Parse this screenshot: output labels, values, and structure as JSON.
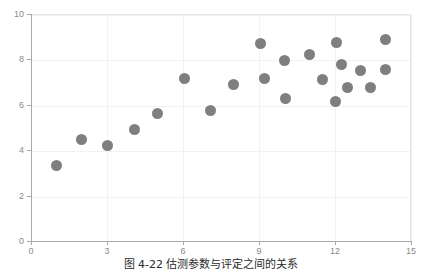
{
  "caption": "图 4-22  估测参数与评定之间的关系",
  "colors": {
    "marker": "#7f7f7f",
    "axis": "#a9a9a9",
    "grid": "#f2f2f2",
    "tick_label": "#8a8a8a",
    "background": "#ffffff",
    "frame": "#e3e3e3"
  },
  "chart_data": {
    "type": "scatter",
    "title": "",
    "xlabel": "",
    "ylabel": "",
    "xlim": [
      0,
      15
    ],
    "ylim": [
      0,
      10
    ],
    "xticks": [
      0,
      3,
      6,
      9,
      12,
      15
    ],
    "yticks": [
      0,
      2,
      4,
      6,
      8,
      10
    ],
    "grid": true,
    "legend": "none",
    "series": [
      {
        "name": "观测值",
        "marker": "circle",
        "color": "#7f7f7f",
        "points": [
          [
            1.0,
            3.35
          ],
          [
            2.0,
            4.5
          ],
          [
            3.0,
            4.25
          ],
          [
            4.1,
            4.95
          ],
          [
            5.0,
            5.65
          ],
          [
            6.05,
            7.2
          ],
          [
            7.1,
            5.8
          ],
          [
            8.0,
            6.95
          ],
          [
            9.05,
            8.75
          ],
          [
            9.2,
            7.2
          ],
          [
            10.0,
            8.0
          ],
          [
            10.05,
            6.3
          ],
          [
            11.0,
            8.25
          ],
          [
            11.5,
            7.15
          ],
          [
            12.0,
            6.2
          ],
          [
            12.05,
            8.8
          ],
          [
            12.25,
            7.8
          ],
          [
            12.5,
            6.8
          ],
          [
            13.0,
            7.55
          ],
          [
            13.4,
            6.8
          ],
          [
            14.0,
            8.9
          ],
          [
            14.0,
            7.6
          ]
        ]
      }
    ]
  }
}
